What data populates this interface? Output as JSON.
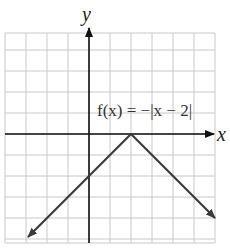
{
  "chart_data": {
    "type": "line",
    "title": "",
    "function_label": "f(x) = −|x − 2|",
    "xlabel": "x",
    "ylabel": "y",
    "xlim": [
      -4,
      6
    ],
    "ylim": [
      -5,
      5
    ],
    "grid": true,
    "grid_step": 1,
    "tick_labels_shown": false,
    "series": [
      {
        "name": "f(x) = −|x − 2|",
        "x": [
          -3,
          2,
          6
        ],
        "y": [
          -5,
          0,
          -4
        ],
        "arrows_at_ends": true
      }
    ],
    "annotations": [
      {
        "text": "f(x) = −|x − 2|",
        "x": 4,
        "y": 1.2
      }
    ]
  },
  "labels": {
    "x_axis": "x",
    "y_axis": "y",
    "function": "f(x) = −|x − 2|"
  },
  "colors": {
    "grid": "#c8c8c8",
    "axis": "#111111",
    "curve": "#3a3a3a",
    "background": "#ffffff"
  }
}
